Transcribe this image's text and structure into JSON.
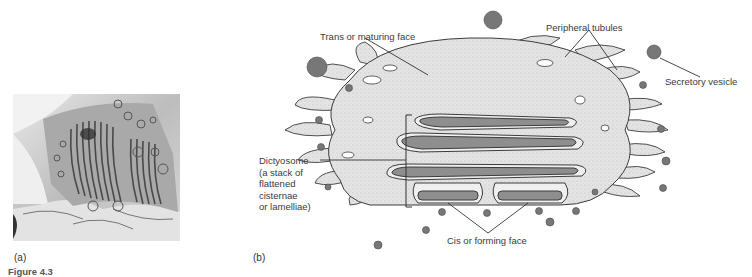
{
  "figure": {
    "panel_a": {
      "label": "(a)",
      "image_description": "electron micrograph of Golgi apparatus stacked cisternae"
    },
    "panel_b": {
      "label": "(b)",
      "image_description": "three-dimensional drawing of a dictyosome with peripheral tubules and vesicles",
      "labels": {
        "trans_face": "Trans or maturing face",
        "peripheral_tubules": "Peripheral tubules",
        "secretory_vesicle": "Secretory vesicle",
        "dictyosome_lines": [
          "Dictyosome",
          "(a stack of",
          "flattened",
          "cisternae",
          "or lamelliae)"
        ],
        "cis_face": "Cis or forming face"
      }
    },
    "caption_partial": "Figure 4.3"
  },
  "colors": {
    "body_fill": "#e2e2e2",
    "cisterna_fill": "#8e8e8e",
    "vesicle_fill": "#777777",
    "outline": "#3c3c3c",
    "label_text": "#3a3a3a"
  }
}
